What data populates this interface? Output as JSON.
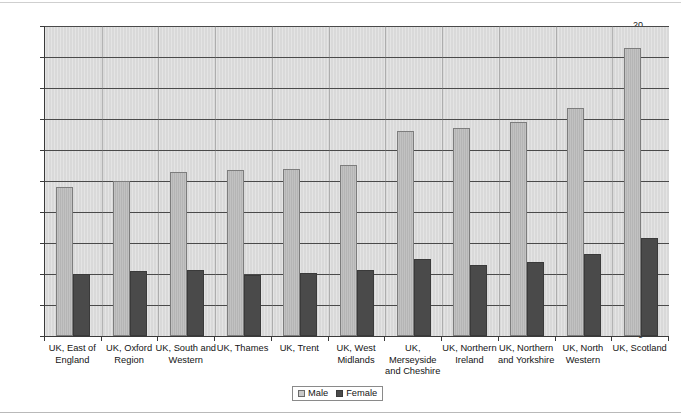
{
  "chart_data": {
    "type": "bar",
    "title": "",
    "xlabel": "",
    "ylabel": "",
    "ylim": [
      0,
      20
    ],
    "ytick_step": 2,
    "yticks": [
      "20",
      "18",
      "16",
      "14",
      "12",
      "10",
      "8",
      "6",
      "4",
      "2",
      "0"
    ],
    "grid": true,
    "legend_position": "bottom",
    "categories": [
      "UK, East of England",
      "UK, Oxford Region",
      "UK, South and Western",
      "UK, Thames",
      "UK, Trent",
      "UK, West Midlands",
      "UK, Merseyside and Cheshire",
      "UK, Northern Ireland",
      "UK, Northern and Yorkshire",
      "UK, North Western",
      "UK, Scotland"
    ],
    "series": [
      {
        "name": "Male",
        "color": "#b5b5b5",
        "values": [
          9.6,
          10.0,
          10.6,
          10.7,
          10.75,
          11.05,
          13.2,
          13.4,
          13.8,
          14.7,
          18.6
        ]
      },
      {
        "name": "Female",
        "color": "#4a4a4a",
        "values": [
          4.0,
          4.2,
          4.25,
          3.95,
          4.05,
          4.25,
          4.95,
          4.6,
          4.8,
          5.3,
          6.35
        ]
      }
    ]
  },
  "legend": {
    "entries": [
      {
        "label": "Male"
      },
      {
        "label": "Female"
      }
    ]
  }
}
